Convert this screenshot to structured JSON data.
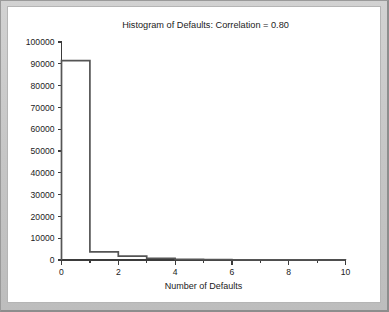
{
  "window": {
    "frame_color": "#c9c9c9",
    "panel_color": "#ffffff"
  },
  "chart_data": {
    "type": "bar",
    "title": "Histogram of Defaults: Correlation = 0.80",
    "xlabel": "Number of Defaults",
    "ylabel": "",
    "grid": false,
    "legend": false,
    "xlim": [
      0,
      10
    ],
    "ylim": [
      0,
      100000
    ],
    "bin_width": 1,
    "bin_edges": [
      0,
      1,
      2,
      3,
      4,
      5,
      6,
      7,
      8,
      9,
      10
    ],
    "categories": [
      "0-1",
      "1-2",
      "2-3",
      "3-4",
      "4-5",
      "5-6",
      "6-7",
      "7-8",
      "8-9",
      "9-10"
    ],
    "values": [
      91500,
      3700,
      1800,
      800,
      300,
      150,
      80,
      40,
      20,
      10
    ],
    "x_tick_labels": [
      "0",
      "2",
      "4",
      "6",
      "8",
      "10"
    ],
    "x_tick_values": [
      0,
      2,
      4,
      6,
      8,
      10
    ],
    "x_minor_tick_values": [
      1,
      3,
      5,
      7,
      9
    ],
    "y_tick_labels": [
      "0",
      "10000",
      "20000",
      "30000",
      "40000",
      "50000",
      "60000",
      "70000",
      "80000",
      "90000",
      "100000"
    ],
    "y_tick_values": [
      0,
      10000,
      20000,
      30000,
      40000,
      50000,
      60000,
      70000,
      80000,
      90000,
      100000
    ],
    "series_color": "#555555",
    "axis_color": "#3b3b3b",
    "text_color": "#222222"
  }
}
